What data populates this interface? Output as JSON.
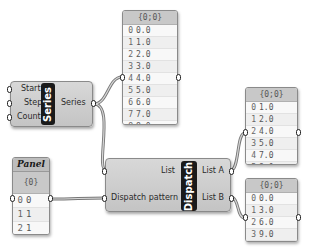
{
  "series_component": {
    "inputs": [
      "Start",
      "Step",
      "Count"
    ],
    "nickname": "Series",
    "output": "Series"
  },
  "dispatch_component": {
    "inputs": [
      "List",
      "Dispatch pattern"
    ],
    "nickname": "Dispatch",
    "outputs": [
      "List A",
      "List B"
    ]
  },
  "panel_series": {
    "header": "{0;0}",
    "rows": [
      {
        "i": "0",
        "v": "0.0"
      },
      {
        "i": "1",
        "v": "1.0"
      },
      {
        "i": "2",
        "v": "2.0"
      },
      {
        "i": "3",
        "v": "3.0"
      },
      {
        "i": "4",
        "v": "4.0"
      },
      {
        "i": "5",
        "v": "5.0"
      },
      {
        "i": "6",
        "v": "6.0"
      },
      {
        "i": "7",
        "v": "7.0"
      },
      {
        "i": "8",
        "v": "8.0"
      },
      {
        "i": "9",
        "v": "9.0"
      }
    ]
  },
  "panel_pattern": {
    "title": "Panel",
    "header": "{0}",
    "rows": [
      {
        "i": "0",
        "v": "0"
      },
      {
        "i": "1",
        "v": "1"
      },
      {
        "i": "2",
        "v": "1"
      }
    ]
  },
  "panel_list_a": {
    "header": "{0;0}",
    "rows": [
      {
        "i": "0",
        "v": "1.0"
      },
      {
        "i": "1",
        "v": "2.0"
      },
      {
        "i": "2",
        "v": "4.0"
      },
      {
        "i": "3",
        "v": "5.0"
      },
      {
        "i": "4",
        "v": "7.0"
      },
      {
        "i": "5",
        "v": "8.0"
      }
    ]
  },
  "panel_list_b": {
    "header": "{0;0}",
    "rows": [
      {
        "i": "0",
        "v": "0.0"
      },
      {
        "i": "1",
        "v": "3.0"
      },
      {
        "i": "2",
        "v": "6.0"
      },
      {
        "i": "3",
        "v": "9.0"
      }
    ]
  }
}
